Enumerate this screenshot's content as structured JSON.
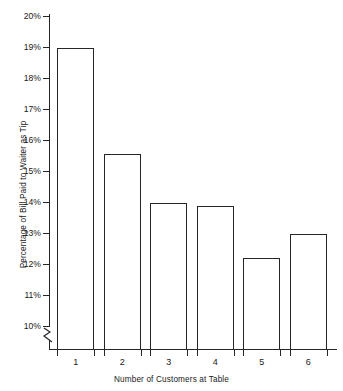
{
  "chart_data": {
    "type": "bar",
    "title": "",
    "xlabel": "Number of Customers at Table",
    "ylabel": "Percentage of Bill Paid to Waiter as Tip",
    "categories": [
      "1",
      "2",
      "3",
      "4",
      "5",
      "6"
    ],
    "values": [
      19.0,
      15.55,
      14.0,
      13.9,
      12.2,
      13.0
    ],
    "ylim": [
      10,
      20
    ],
    "ytick_labels": [
      "10%",
      "11%",
      "12%",
      "13%",
      "14%",
      "15%",
      "16%",
      "17%",
      "18%",
      "19%",
      "20%"
    ],
    "ytick_values": [
      10,
      11,
      12,
      13,
      14,
      15,
      16,
      17,
      18,
      19,
      20
    ],
    "grid": false,
    "legend": false,
    "axis_break": true,
    "bar_fill_color": "#ffffff",
    "bar_edge_color": "#262626",
    "axis_color": "#262626"
  }
}
